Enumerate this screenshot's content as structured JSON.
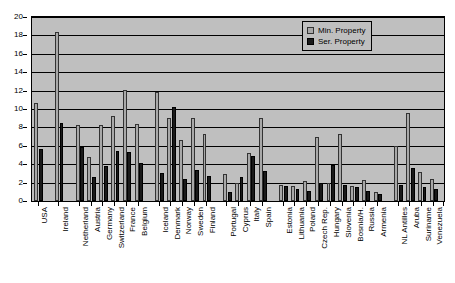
{
  "chart_data": {
    "type": "bar",
    "title": "",
    "xlabel": "",
    "ylabel": "",
    "ylim": [
      0,
      20
    ],
    "ytick_step": 2,
    "yticks": [
      0,
      2,
      4,
      6,
      8,
      10,
      12,
      14,
      16,
      18,
      20
    ],
    "grid": true,
    "legend_position": "top-right",
    "orientation": "vertical",
    "group_gaps_after": [
      "USA",
      "Ireland",
      "Belgium",
      "Finland",
      "Spain",
      "Armenia"
    ],
    "categories": [
      "USA",
      "Ireland",
      "Netherland",
      "Austria",
      "Germany",
      "Switzerland",
      "France",
      "Belgium",
      "Iceland",
      "Denmark",
      "Norway",
      "Sweden",
      "Finland",
      "Portugal",
      "Cyprus",
      "Italy",
      "Spain",
      "Estonia",
      "Lithuania",
      "Poland",
      "Czech Rep.",
      "Hungary",
      "Slovenia",
      "Bosnia/H.",
      "Russia",
      "Armenia",
      "NL Antilles",
      "Aruba",
      "Suriname",
      "Venezuela"
    ],
    "series": [
      {
        "name": "Min. Property",
        "color": "#a8a8a8",
        "values": [
          10.7,
          18.4,
          8.3,
          4.8,
          8.3,
          9.2,
          12.1,
          8.4,
          11.9,
          9.0,
          6.6,
          9.0,
          7.3,
          2.9,
          2.0,
          5.2,
          9.0,
          1.7,
          1.6,
          2.2,
          7.0,
          2.0,
          7.3,
          1.6,
          2.3,
          1.0,
          6.0,
          9.6,
          3.1,
          2.4
        ]
      },
      {
        "name": "Ser. Property",
        "color": "#1a1a1a",
        "values": [
          5.6,
          8.5,
          5.9,
          2.6,
          3.8,
          5.4,
          5.3,
          4.1,
          3.0,
          10.2,
          2.4,
          3.4,
          2.7,
          1.0,
          2.6,
          4.9,
          3.3,
          1.6,
          1.3,
          1.1,
          2.0,
          3.9,
          1.7,
          1.5,
          1.1,
          0.8,
          1.7,
          3.6,
          1.5,
          1.3
        ]
      }
    ]
  },
  "legend": {
    "items": [
      {
        "label": "Min. Property",
        "marker": "min-property-swatch"
      },
      {
        "label": "Ser. Property",
        "marker": "ser-property-swatch"
      }
    ]
  }
}
